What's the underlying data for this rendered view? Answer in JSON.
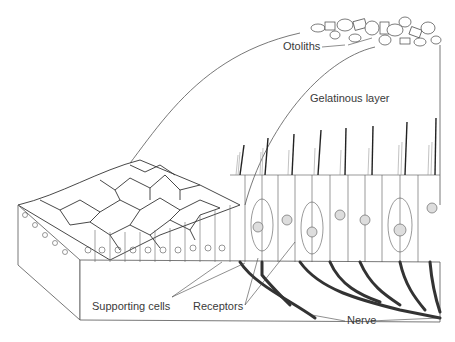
{
  "figure": {
    "type": "anatomical-illustration",
    "labels": {
      "otoliths": "Otoliths",
      "gelatinous_layer": "Gelatinous layer",
      "supporting_cells": "Supporting cells",
      "receptors": "Receptors",
      "nerve": "Nerve"
    }
  },
  "colors": {
    "line": "#4a4a4a",
    "nerve": "#3a3a3a",
    "background": "#ffffff"
  }
}
